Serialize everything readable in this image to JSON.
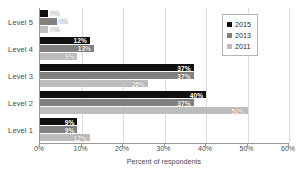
{
  "chart_data": {
    "type": "bar",
    "orientation": "horizontal",
    "title": "",
    "xlabel": "Percent of respondents",
    "ylabel": "",
    "xlim": [
      0,
      60
    ],
    "xticks": [
      "0%",
      "10%",
      "20%",
      "30%",
      "40%",
      "50%",
      "60%"
    ],
    "xtick_values": [
      0,
      10,
      20,
      30,
      40,
      50,
      60
    ],
    "grid": true,
    "legend_position": "top-right",
    "categories": [
      "Level 5",
      "Level 4",
      "Level 3",
      "Level 2",
      "Level 1"
    ],
    "series": [
      {
        "name": "2015",
        "color": "#101010",
        "values": [
          2,
          12,
          37,
          40,
          9
        ],
        "labels": [
          "2%",
          "12%",
          "37%",
          "40%",
          "9%"
        ]
      },
      {
        "name": "2013",
        "color": "#808080",
        "values": [
          4,
          13,
          37,
          37,
          9
        ],
        "labels": [
          "4%",
          "13%",
          "37%",
          "37%",
          "9%"
        ]
      },
      {
        "name": "2011",
        "color": "#bdbdbd",
        "values": [
          2,
          9,
          26,
          50,
          12
        ],
        "labels": [
          "2%",
          "9%",
          "26%",
          "50%",
          "12%"
        ]
      }
    ]
  },
  "legend": {
    "items": [
      {
        "label": "2015",
        "color": "#101010"
      },
      {
        "label": "2013",
        "color": "#808080"
      },
      {
        "label": "2011",
        "color": "#bdbdbd"
      }
    ]
  },
  "axis": {
    "x_title": "Percent of respondents"
  }
}
